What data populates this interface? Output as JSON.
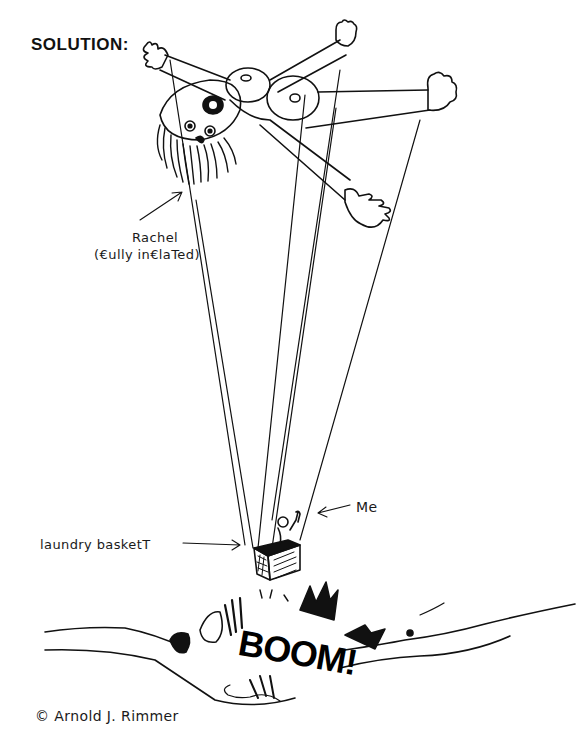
{
  "title": "SOLUTION:",
  "labels": {
    "rachel_line1": "Rachel",
    "rachel_line2": "(€ully in€laTed)",
    "me": "Me",
    "basket": "laundry basketT",
    "credit": "© Arnold J. Rimmer"
  },
  "sound_effect": "BOOM!",
  "colors": {
    "ink": "#111111",
    "paper": "#ffffff"
  }
}
